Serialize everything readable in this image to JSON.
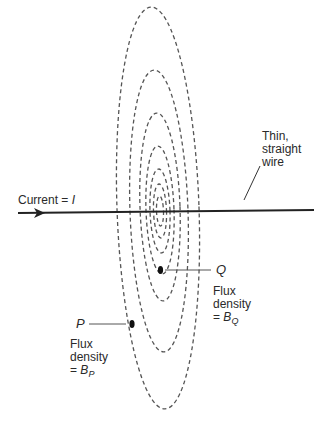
{
  "diagram": {
    "wire": {
      "label_line1": "Thin,",
      "label_line2": "straight",
      "label_line3": "wire"
    },
    "current": {
      "label": "Current",
      "equals": "=",
      "symbol": "I"
    },
    "point_q": {
      "name": "Q",
      "label_line1": "Flux",
      "label_line2": "density",
      "label_eq": "=",
      "symbol": "B",
      "subscript": "Q"
    },
    "point_p": {
      "name": "P",
      "label_line1": "Flux",
      "label_line2": "density",
      "label_eq": "=",
      "symbol": "B",
      "subscript": "P"
    },
    "field_lines": {
      "style": "dashed",
      "count": 7,
      "color": "#555555"
    }
  }
}
